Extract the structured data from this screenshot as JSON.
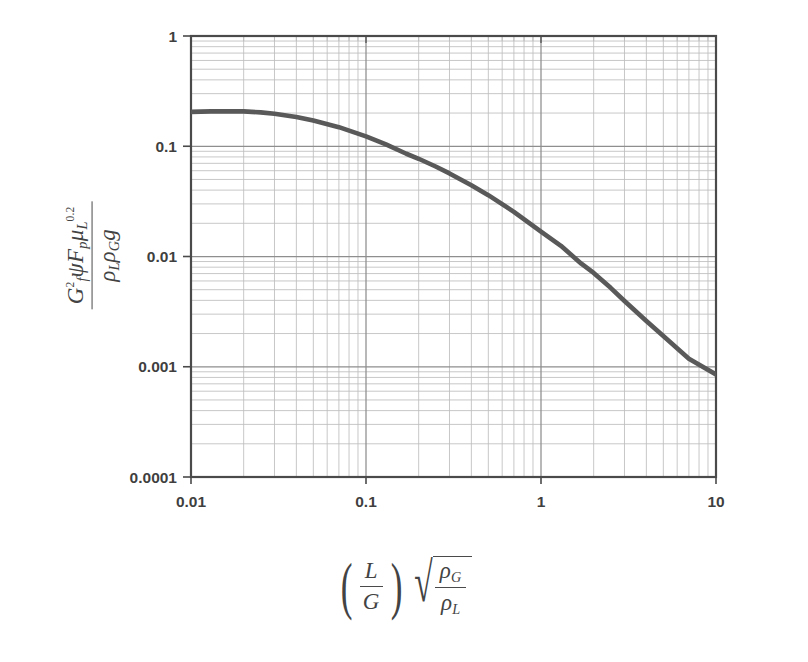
{
  "chart_data": {
    "type": "line",
    "title": "",
    "xlabel": "(L/G) sqrt(rho_G / rho_L)",
    "ylabel": "G_f^2 psi F_p mu_L^0.2 / (rho_L rho_G g)",
    "xscale": "log",
    "yscale": "log",
    "xlim": [
      0.01,
      10
    ],
    "ylim": [
      0.0001,
      1
    ],
    "xticks": [
      "0.01",
      "0.1",
      "1",
      "10"
    ],
    "xtick_values": [
      0.01,
      0.1,
      1,
      10
    ],
    "yticks": [
      "1",
      "0.1",
      "0.01",
      "0.001",
      "0.0001"
    ],
    "ytick_values": [
      1,
      0.1,
      0.01,
      0.001,
      0.0001
    ],
    "grid": true,
    "grid_minor": true,
    "legend": "none",
    "series": [
      {
        "name": "Generalized pressure drop / flooding correlation",
        "color": "#595959",
        "x": [
          0.01,
          0.013,
          0.017,
          0.02,
          0.025,
          0.03,
          0.04,
          0.05,
          0.07,
          0.1,
          0.13,
          0.17,
          0.2,
          0.25,
          0.3,
          0.4,
          0.5,
          0.7,
          1.0,
          1.3,
          1.7,
          2.0,
          2.5,
          3.0,
          4.0,
          5.0,
          7.0,
          10.0
        ],
        "y": [
          0.205,
          0.207,
          0.208,
          0.207,
          0.203,
          0.197,
          0.184,
          0.171,
          0.149,
          0.123,
          0.104,
          0.0855,
          0.077,
          0.0655,
          0.0567,
          0.0443,
          0.036,
          0.0254,
          0.0168,
          0.0125,
          0.0086,
          0.0071,
          0.0052,
          0.00395,
          0.0026,
          0.0019,
          0.00118,
          0.00085
        ]
      }
    ]
  },
  "axis": {
    "y_tick_labels": [
      "1",
      "0.1",
      "0.01",
      "0.001",
      "0.0001"
    ],
    "x_tick_labels": [
      "0.01",
      "0.1",
      "1",
      "10"
    ]
  },
  "ylabel_parts": {
    "numerator": {
      "G": "G",
      "G_sub": "f",
      "G_sup": "2",
      "psi": "ψ",
      "F": "F",
      "F_sub": "p",
      "mu": "μ",
      "mu_sub": "L",
      "mu_sup": "0.2"
    },
    "denominator": {
      "rho1": "ρ",
      "rho1_sub": "L",
      "rho2": "ρ",
      "rho2_sub": "G",
      "g": "g"
    }
  },
  "xlabel_parts": {
    "L": "L",
    "G": "G",
    "paren_open": "(",
    "paren_close": ")",
    "radical": "√",
    "rho_G": "ρ",
    "rho_G_sub": "G",
    "rho_L": "ρ",
    "rho_L_sub": "L"
  },
  "colors": {
    "curve": "#595959",
    "axis": "#4a4a4a",
    "major_grid": "#8e8e8e",
    "minor_grid": "#bdbdbd",
    "text": "#3f3f3f",
    "background": "#ffffff"
  }
}
